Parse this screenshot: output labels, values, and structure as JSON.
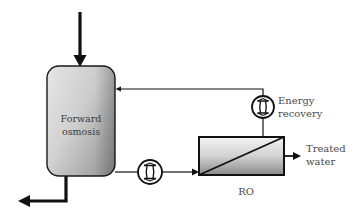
{
  "diagram": {
    "type": "process-flow",
    "nodes": {
      "forward_osmosis": {
        "label_line1": "Forward",
        "label_line2": "osmosis"
      },
      "pump": {
        "icon": "pump-icon"
      },
      "energy_recovery": {
        "label_line1": "Energy",
        "label_line2": "recovery",
        "icon": "energy-recovery-icon"
      },
      "ro": {
        "label": "RO"
      },
      "treated_water": {
        "label_line1": "Treated",
        "label_line2": "water"
      }
    },
    "edges": [
      {
        "from": "feed-inlet",
        "to": "forward_osmosis"
      },
      {
        "from": "forward_osmosis",
        "to": "pump"
      },
      {
        "from": "pump",
        "to": "ro"
      },
      {
        "from": "ro",
        "to": "energy_recovery"
      },
      {
        "from": "energy_recovery",
        "to": "forward_osmosis"
      },
      {
        "from": "ro",
        "to": "treated_water"
      },
      {
        "from": "forward_osmosis",
        "to": "concentrate-outlet"
      }
    ],
    "colors": {
      "line": "#111111",
      "fill_light": "#f2f2f2",
      "fill_dark": "#8c8c8c",
      "text": "#4a4a4a"
    }
  }
}
